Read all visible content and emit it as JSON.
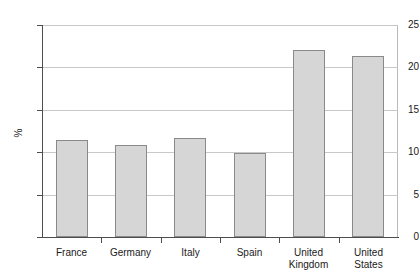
{
  "chart_data": {
    "type": "bar",
    "title": "",
    "subtitle": "",
    "xlabel": "",
    "ylabel": "%",
    "categories": [
      "France",
      "Germany",
      "Italy",
      "Spain",
      "United\nKingdom",
      "United\nStates"
    ],
    "values": [
      11.4,
      10.9,
      11.7,
      9.9,
      22.1,
      21.3
    ],
    "ylim": [
      0,
      25
    ],
    "yticks": [
      0,
      5,
      10,
      15,
      20,
      25
    ],
    "ytick_labels": [
      "0",
      "5",
      "10",
      "15",
      "20",
      "25"
    ],
    "grid": true,
    "grid_axis": "y",
    "legend": null,
    "legend_position": "none",
    "annotations": [],
    "bar_fill_color": "#d6d6d6",
    "bar_edge_color": "#8a8a8a",
    "gridline_color": "#c8c8c8",
    "axis_color": "#4d4d4d",
    "frame_color": "#b9b9b9",
    "background_color": "#ffffff",
    "text_color": "#1a1a1a"
  }
}
